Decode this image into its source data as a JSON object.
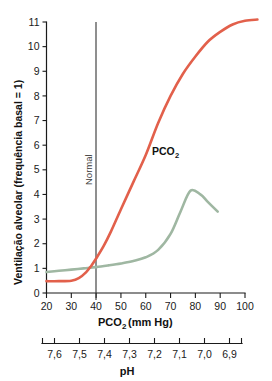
{
  "chart_data": {
    "type": "line",
    "title": "",
    "xlabel": "PCO2 (mm Hg)",
    "xlabel_main": "PCO",
    "xlabel_sub": "2",
    "xlabel_unit": "(mm Hg)",
    "ylabel": "Ventilação alveolar (frequência basal = 1)",
    "secondary_xlabel": "pH",
    "xlim": [
      20,
      100
    ],
    "ylim": [
      0,
      11
    ],
    "xticks": [
      20,
      30,
      40,
      50,
      60,
      70,
      80,
      90,
      100
    ],
    "xtick_labels": [
      "20",
      "30",
      "40",
      "50",
      "60",
      "70",
      "80",
      "90",
      "100"
    ],
    "yticks": [
      0,
      1,
      2,
      3,
      4,
      5,
      6,
      7,
      8,
      9,
      10,
      11
    ],
    "ytick_labels": [
      "0",
      "1",
      "2",
      "3",
      "4",
      "5",
      "6",
      "7",
      "8",
      "9",
      "10",
      "11"
    ],
    "ph_ticks": [
      "7,6",
      "7,5",
      "7,4",
      "7,3",
      "7,2",
      "7,1",
      "7,0",
      "6,9"
    ],
    "grid": false,
    "legend_position": "inline-annotation",
    "annotations": [
      {
        "text": "Normal",
        "x": 40,
        "y": 6.2,
        "rotation": -90,
        "color": "#3a3a3a"
      },
      {
        "text": "PCO2",
        "label_main": "PCO",
        "label_sub": "2",
        "x": 62,
        "y": 5.7,
        "color": "#111111"
      }
    ],
    "reference_lines": [
      {
        "name": "normal",
        "axis": "x",
        "value": 40,
        "color": "#333333"
      }
    ],
    "series": [
      {
        "name": "PCO2",
        "color": "#E2604B",
        "x": [
          20,
          25,
          30,
          33,
          36,
          38,
          40,
          43,
          46,
          50,
          55,
          60,
          65,
          70,
          75,
          80,
          85,
          90,
          95,
          100,
          105
        ],
        "values": [
          0.48,
          0.48,
          0.5,
          0.6,
          0.85,
          1.1,
          1.4,
          1.9,
          2.5,
          3.4,
          4.5,
          5.6,
          6.9,
          8.0,
          8.9,
          9.6,
          10.2,
          10.6,
          10.9,
          11.05,
          11.1
        ]
      },
      {
        "name": "pH",
        "color": "#9FB7A2",
        "x": [
          20,
          25,
          30,
          35,
          40,
          45,
          50,
          55,
          60,
          65,
          70,
          74,
          78,
          82,
          85,
          89
        ],
        "values": [
          0.85,
          0.9,
          0.95,
          1.0,
          1.05,
          1.12,
          1.2,
          1.3,
          1.45,
          1.75,
          2.4,
          3.3,
          4.15,
          4.0,
          3.7,
          3.3
        ]
      }
    ]
  }
}
